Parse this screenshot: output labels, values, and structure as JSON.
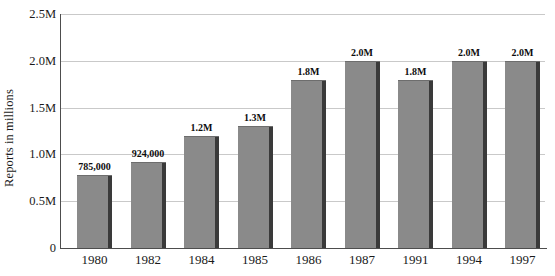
{
  "chart_data": {
    "type": "bar",
    "title": "",
    "subtitle": "",
    "xlabel": "",
    "ylabel": "Reports in millions",
    "categories": [
      "1980",
      "1982",
      "1984",
      "1985",
      "1986",
      "1987",
      "1991",
      "1994",
      "1997"
    ],
    "values": [
      785000,
      924000,
      1200000,
      1300000,
      1800000,
      2000000,
      1800000,
      2000000,
      2000000
    ],
    "data_labels": [
      "785,000",
      "924,000",
      "1.2M",
      "1.3M",
      "1.8M",
      "2.0M",
      "1.8M",
      "2.0M",
      "2.0M"
    ],
    "ylim": [
      0,
      2500000
    ],
    "yticks": [
      0,
      500000,
      1000000,
      1500000,
      2000000,
      2500000
    ],
    "ytick_labels": [
      "0",
      "0.5M",
      "1.0M",
      "1.5M",
      "2.0M",
      "2.5M"
    ],
    "grid": true,
    "grid_axis": "y",
    "legend": false,
    "series": [
      {
        "name": "Reports",
        "color": "#878787",
        "values": [
          785000,
          924000,
          1200000,
          1300000,
          1800000,
          2000000,
          1800000,
          2000000,
          2000000
        ]
      }
    ],
    "colors": {
      "bar_fill": "#878787",
      "bar_shadow": "#3a3a3a",
      "gridline": "#c9c9c9",
      "axis": "#4d4d4d",
      "text": "#1a1a1a",
      "background": "#ffffff"
    }
  }
}
